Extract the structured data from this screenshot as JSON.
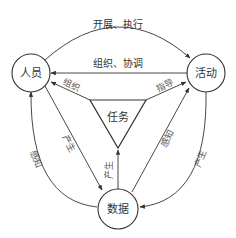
{
  "diagram": {
    "nodes": [
      {
        "id": "people",
        "label": "人员",
        "shape": "circle"
      },
      {
        "id": "activity",
        "label": "活动",
        "shape": "circle"
      },
      {
        "id": "data",
        "label": "数据",
        "shape": "circle"
      },
      {
        "id": "task",
        "label": "任务",
        "shape": "inverted-triangle"
      }
    ],
    "edges": [
      {
        "from": "people",
        "to": "activity",
        "label": "开展、执行"
      },
      {
        "from": "activity",
        "to": "people",
        "label": "组织、协调"
      },
      {
        "from": "task",
        "to": "people",
        "label": "组织"
      },
      {
        "from": "task",
        "to": "activity",
        "label": "指导"
      },
      {
        "from": "data",
        "to": "task",
        "label": "产生"
      },
      {
        "from": "people",
        "to": "data",
        "label": "产生"
      },
      {
        "from": "data",
        "to": "people",
        "label": "感知"
      },
      {
        "from": "data",
        "to": "activity",
        "label": "感知"
      },
      {
        "from": "activity",
        "to": "data",
        "label": "产生"
      }
    ],
    "colors": {
      "stroke": "#333333",
      "background": "#ffffff"
    }
  }
}
